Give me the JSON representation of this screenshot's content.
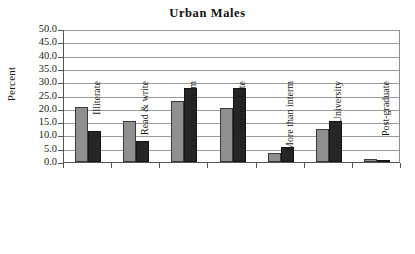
{
  "chart_data": {
    "type": "bar",
    "title": "Urban Males",
    "xlabel": "",
    "ylabel": "Percent",
    "ylim": [
      0,
      50
    ],
    "ytick_step": 5,
    "yticks": [
      "50.0",
      "45.0",
      "40.0",
      "35.0",
      "30.0",
      "25.0",
      "20.0",
      "15.0",
      "10.0",
      "5.0",
      "0.0"
    ],
    "grid": true,
    "legend": "none",
    "categories": [
      "Illiterate",
      "Read & write",
      "Less than interm.",
      "Intermediate",
      "More than interm.",
      "University",
      "Post-graduate"
    ],
    "series": [
      {
        "name": "series-1",
        "color": "#8f8f8f",
        "values": [
          20.8,
          15.3,
          23.1,
          20.4,
          3.5,
          12.4,
          1.3
        ]
      },
      {
        "name": "series-2",
        "color": "#262626",
        "values": [
          11.5,
          8.0,
          27.9,
          27.7,
          5.5,
          15.6,
          0.4
        ]
      }
    ]
  },
  "figure": {
    "background": "#ffffff",
    "axis_color": "#555555",
    "gridline_color": "#9a9a9a"
  }
}
